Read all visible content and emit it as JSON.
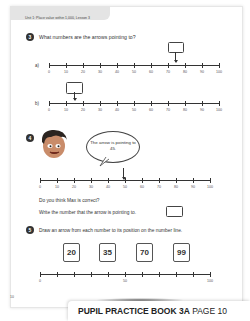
{
  "header": {
    "unit_text": "Unit 1: Place value within 1,000, Lesson 3"
  },
  "q3": {
    "number": "3",
    "prompt": "What numbers are the arrows pointing to?",
    "parts": [
      {
        "label": "a)",
        "ticks": [
          "0",
          "10",
          "20",
          "30",
          "40",
          "50",
          "60",
          "70",
          "80",
          "90",
          "100"
        ],
        "answer": ""
      },
      {
        "label": "b)",
        "ticks": [
          "0",
          "10",
          "20",
          "30",
          "40",
          "50",
          "60",
          "70",
          "80",
          "90",
          "100"
        ],
        "answer": ""
      }
    ]
  },
  "q4": {
    "number": "4",
    "speech": "The arrow is pointing to 45.",
    "ticks": [
      "0",
      "10",
      "20",
      "30",
      "40",
      "50",
      "60",
      "70",
      "80",
      "90",
      "100"
    ],
    "question": "Do you think Max is correct?",
    "instruction": "Write the number that the arrow is pointing to.",
    "answer": ""
  },
  "q5": {
    "number": "5",
    "prompt": "Draw an arrow from each number to its position on the number line.",
    "cards": [
      "20",
      "35",
      "70",
      "99"
    ],
    "ticks": [
      "0",
      "50",
      "100"
    ]
  },
  "page_number": "10",
  "footer": {
    "book": "PUPIL PRACTICE BOOK 3A",
    "page": "PAGE 10"
  }
}
